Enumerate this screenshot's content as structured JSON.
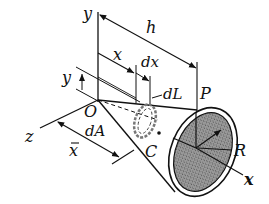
{
  "figure": {
    "colors": {
      "line": "#111111",
      "base_fill": "#8a8a8a",
      "background": "#ffffff"
    },
    "labels": {
      "y_axis": "y",
      "h": "h",
      "x": "x",
      "dx": "dx",
      "y_small": "y",
      "dL": "dL",
      "P": "P",
      "O": "O",
      "z_axis": "z",
      "dA": "dA",
      "x_bar": "x",
      "C": "C",
      "R": "R",
      "x_axis": "x"
    }
  }
}
